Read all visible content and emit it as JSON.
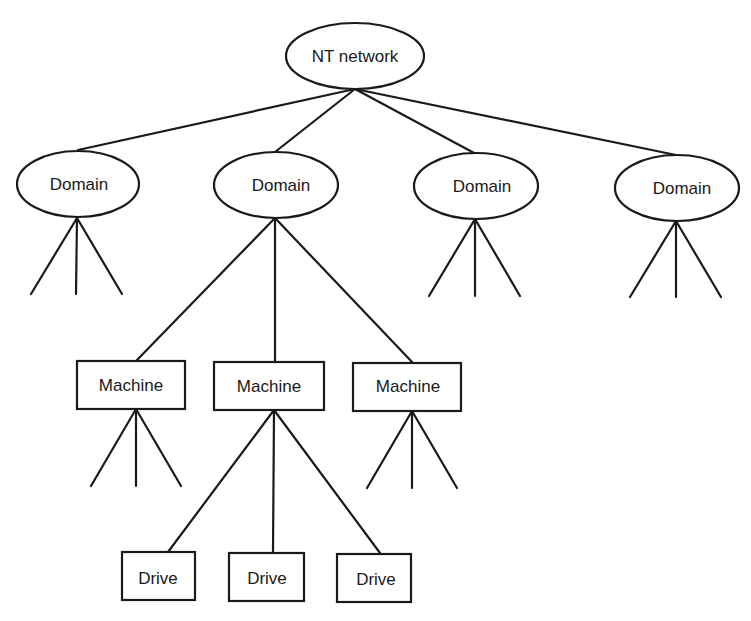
{
  "diagram": {
    "type": "tree",
    "root": {
      "label": "NT network",
      "shape": "ellipse"
    },
    "domains": [
      {
        "label": "Domain",
        "shape": "ellipse"
      },
      {
        "label": "Domain",
        "shape": "ellipse"
      },
      {
        "label": "Domain",
        "shape": "ellipse"
      },
      {
        "label": "Domain",
        "shape": "ellipse"
      }
    ],
    "machines": [
      {
        "label": "Machine",
        "shape": "rectangle"
      },
      {
        "label": "Machine",
        "shape": "rectangle"
      },
      {
        "label": "Machine",
        "shape": "rectangle"
      }
    ],
    "drives": [
      {
        "label": "Drive",
        "shape": "rectangle"
      },
      {
        "label": "Drive",
        "shape": "rectangle"
      },
      {
        "label": "Drive",
        "shape": "rectangle"
      }
    ],
    "stroke_color": "#1a1a1a"
  }
}
